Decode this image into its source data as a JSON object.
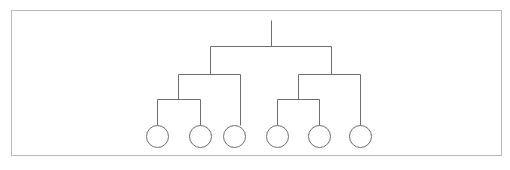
{
  "canvas": {
    "width": 510,
    "height": 170,
    "background_color": "#ffffff"
  },
  "frame": {
    "label": "diagram-border",
    "x": 11,
    "y": 10,
    "width": 490,
    "height": 145,
    "stroke_color": "#b9b9b9",
    "stroke_width": 1
  },
  "diagram": {
    "title": "",
    "type": "binary-hierarchy-tree",
    "orientation": "top-down",
    "leaf_count": 6,
    "depth_levels": 4,
    "stroke_color": "#6e6e6e",
    "stroke_width": 1,
    "leaf_radius": 11,
    "leaf_fill": "none"
  },
  "chart_data": {
    "type": "tree",
    "title": "",
    "xlabel": "",
    "ylabel": "",
    "leaf_count": 6,
    "levels": [
      {
        "name": "root-stem",
        "y": 46
      },
      {
        "name": "level-1-bar",
        "y": 46
      },
      {
        "name": "level-2-bar",
        "y": 74
      },
      {
        "name": "level-3-bar",
        "y": 99
      },
      {
        "name": "leaf-row",
        "y": 136
      }
    ],
    "leaves": [
      {
        "id": "leaf-1",
        "label": "",
        "cx": 157,
        "cy": 136,
        "r": 11
      },
      {
        "id": "leaf-2",
        "label": "",
        "cx": 200,
        "cy": 136,
        "r": 11
      },
      {
        "id": "leaf-3",
        "label": "",
        "cx": 234,
        "cy": 136,
        "r": 11
      },
      {
        "id": "leaf-4",
        "label": "",
        "cx": 277,
        "cy": 136,
        "r": 11
      },
      {
        "id": "leaf-5",
        "label": "",
        "cx": 319,
        "cy": 136,
        "r": 11
      },
      {
        "id": "leaf-6",
        "label": "",
        "cx": 360,
        "cy": 136,
        "r": 11
      }
    ],
    "edges": [
      {
        "id": "root-stem",
        "x1": 271,
        "y1": 20,
        "x2": 271,
        "y2": 46
      },
      {
        "id": "level1-bar",
        "x1": 210,
        "y1": 46,
        "x2": 331,
        "y2": 46
      },
      {
        "id": "level1-left-drop",
        "x1": 210,
        "y1": 46,
        "x2": 210,
        "y2": 74
      },
      {
        "id": "level1-right-drop",
        "x1": 331,
        "y1": 46,
        "x2": 331,
        "y2": 74
      },
      {
        "id": "level2-left-bar",
        "x1": 178,
        "y1": 74,
        "x2": 240,
        "y2": 74
      },
      {
        "id": "level2-left-l-drop",
        "x1": 178,
        "y1": 74,
        "x2": 178,
        "y2": 99
      },
      {
        "id": "level2-left-r-drop",
        "x1": 240,
        "y1": 74,
        "x2": 240,
        "y2": 125
      },
      {
        "id": "level2-right-bar",
        "x1": 298,
        "y1": 74,
        "x2": 360,
        "y2": 74
      },
      {
        "id": "level2-right-l-drop",
        "x1": 298,
        "y1": 74,
        "x2": 298,
        "y2": 99
      },
      {
        "id": "level2-right-r-drop",
        "x1": 360,
        "y1": 74,
        "x2": 360,
        "y2": 125
      },
      {
        "id": "level3-left-bar",
        "x1": 157,
        "y1": 99,
        "x2": 200,
        "y2": 99
      },
      {
        "id": "level3-left-l-drop",
        "x1": 157,
        "y1": 99,
        "x2": 157,
        "y2": 125
      },
      {
        "id": "level3-left-r-drop",
        "x1": 200,
        "y1": 99,
        "x2": 200,
        "y2": 125
      },
      {
        "id": "level3-right-bar",
        "x1": 277,
        "y1": 99,
        "x2": 319,
        "y2": 99
      },
      {
        "id": "level3-right-l-drop",
        "x1": 277,
        "y1": 99,
        "x2": 277,
        "y2": 125
      },
      {
        "id": "level3-right-r-drop",
        "x1": 319,
        "y1": 99,
        "x2": 319,
        "y2": 125
      }
    ]
  }
}
